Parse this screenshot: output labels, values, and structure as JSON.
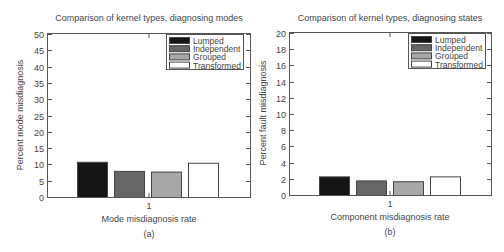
{
  "chart_data": [
    {
      "id": "a",
      "type": "bar",
      "title": "Comparison of kernel types, diagnosing modes",
      "xlabel": "Mode misdiagnosis rate",
      "ylabel": "Percent mode misdiagnosis",
      "panel_label": "(a)",
      "categories": [
        "1"
      ],
      "series": [
        {
          "name": "Lumped",
          "color": "#151515",
          "values": [
            10.8
          ]
        },
        {
          "name": "Independent",
          "color": "#666666",
          "values": [
            8.0
          ]
        },
        {
          "name": "Grouped",
          "color": "#a8a8a8",
          "values": [
            7.8
          ]
        },
        {
          "name": "Transformed",
          "color": "#ffffff",
          "values": [
            10.5
          ]
        }
      ],
      "ylim": [
        0,
        50
      ],
      "yticks": [
        0,
        5,
        10,
        15,
        20,
        25,
        30,
        35,
        40,
        45,
        50
      ],
      "grid": false,
      "legend_position": "upper right"
    },
    {
      "id": "b",
      "type": "bar",
      "title": "Comparison of kernel types, diagnosing states",
      "xlabel": "Component misdiagnosis rate",
      "ylabel": "Percent fault misdiagnosis",
      "panel_label": "(b)",
      "categories": [
        "1"
      ],
      "series": [
        {
          "name": "Lumped",
          "color": "#151515",
          "values": [
            2.3
          ]
        },
        {
          "name": "Independent",
          "color": "#666666",
          "values": [
            1.8
          ]
        },
        {
          "name": "Grouped",
          "color": "#a8a8a8",
          "values": [
            1.7
          ]
        },
        {
          "name": "Transformed",
          "color": "#ffffff",
          "values": [
            2.3
          ]
        }
      ],
      "ylim": [
        0,
        20
      ],
      "yticks": [
        0,
        2,
        4,
        6,
        8,
        10,
        12,
        14,
        16,
        18,
        20
      ],
      "grid": false,
      "legend_position": "upper right"
    }
  ]
}
